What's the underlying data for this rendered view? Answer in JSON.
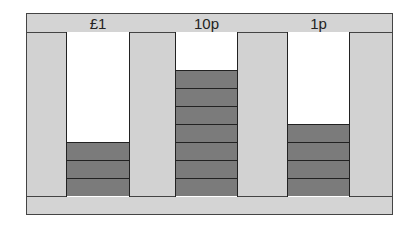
{
  "diagram": {
    "type": "place-value-stacks",
    "columns": [
      {
        "label": "£1",
        "left": 66,
        "width": 64,
        "count": 3
      },
      {
        "label": "10p",
        "left": 175,
        "width": 63,
        "count": 7
      },
      {
        "label": "1p",
        "left": 287,
        "width": 63,
        "count": 4
      }
    ],
    "block_height_px": 18,
    "base_y": 196
  },
  "colors": {
    "frame": "#d2d2d2",
    "block": "#7b7b7b",
    "border": "#222222",
    "column_bg": "#ffffff"
  }
}
